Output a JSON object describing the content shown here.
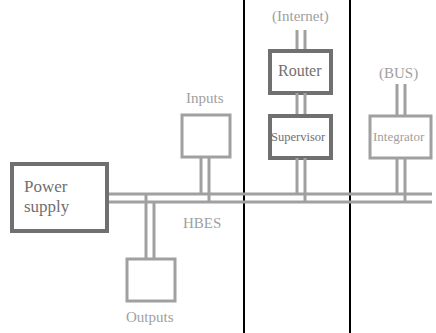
{
  "diagram": {
    "bus_label": "HBES",
    "colors": {
      "light_gray": "#a0a0a0",
      "dark_gray": "#707070",
      "divider": "#000000",
      "background": "#ffffff"
    },
    "nodes": {
      "power_supply": {
        "label_line1": "Power",
        "label_line2": "supply"
      },
      "inputs": {
        "label": "Inputs"
      },
      "outputs": {
        "label": "Outputs"
      },
      "router": {
        "label": "Router"
      },
      "supervisor": {
        "label": "Supervisor"
      },
      "integrator": {
        "label": "Integrator"
      }
    },
    "external": {
      "internet": "(Internet)",
      "bus": "(BUS)"
    }
  }
}
